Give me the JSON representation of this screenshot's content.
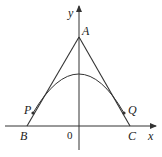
{
  "diagram": {
    "axes": {
      "x_label": "x",
      "y_label": "y",
      "origin_label": "0"
    },
    "points": {
      "A": {
        "label": "A"
      },
      "B": {
        "label": "B"
      },
      "C": {
        "label": "C"
      },
      "P": {
        "label": "P"
      },
      "Q": {
        "label": "Q"
      }
    },
    "colors": {
      "stroke": "#333333",
      "background": "#ffffff"
    }
  }
}
